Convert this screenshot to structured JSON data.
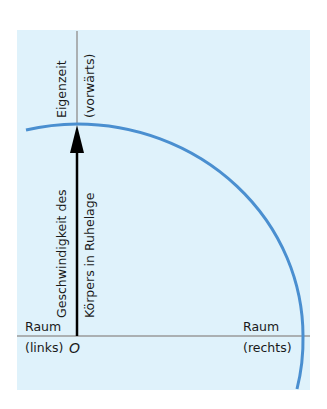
{
  "diagram": {
    "axes": {
      "vertical_top_label_line1": "Eigenzeit",
      "vertical_top_label_line2": "(vorwärts)",
      "horizontal_left_label_line1": "Raum",
      "horizontal_left_label_line2": "(links)",
      "horizontal_right_label_line1": "Raum",
      "horizontal_right_label_line2": "(rechts)",
      "origin_label": "O"
    },
    "arrow": {
      "label_line1": "Geschwindigkeit des",
      "label_line2": "Körpers in Ruhelage"
    },
    "colors": {
      "background": "#dff2fb",
      "arc": "#4a8fd0",
      "axis": "#9a9a9a",
      "arrow": "#000000"
    }
  }
}
